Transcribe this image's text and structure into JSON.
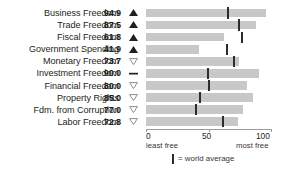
{
  "header": {
    "title": "INDONESIA'S ECONOMIC FREEDOMS"
  },
  "axis": {
    "ticks": [
      "0",
      "50",
      "100"
    ],
    "least_free_label": "least free",
    "most_free_label": "most free",
    "min": 0,
    "max": 100
  },
  "legend": {
    "marker_name": "world-average-marker",
    "text": "= world average"
  },
  "colors": {
    "bar_fill": "#c8c8c8",
    "marker": "#2f2b2c",
    "axis": "#9b9b9b",
    "text": "#231f20"
  },
  "trend_symbols": {
    "up_filled": "up-triangle-filled-icon",
    "down_hollow": "down-triangle-hollow-icon",
    "flat_dash": "flat-dash-icon"
  },
  "chart_data": {
    "type": "bar",
    "title": "INDONESIA'S ECONOMIC FREEDOMS",
    "xlabel": "",
    "ylabel": "",
    "xlim": [
      0,
      100
    ],
    "grid": false,
    "legend_position": "bottom",
    "orientation": "horizontal",
    "categories": [
      "Business Freedom",
      "Trade Freedom",
      "Fiscal Freedom",
      "Government Spending",
      "Monetary Freedom",
      "Investment Freedom",
      "Financial Freedom",
      "Property Rights",
      "Fdm. from Corruption",
      "Labor Freedom"
    ],
    "values": [
      94.9,
      87.5,
      61.8,
      41.9,
      73.7,
      90.0,
      80.0,
      85.0,
      77.0,
      72.8
    ],
    "value_labels": [
      "94.9",
      "87.5",
      "61.8",
      "41.9",
      "73.7",
      "90.0",
      "80.0",
      "85.0",
      "77.0",
      "72.8"
    ],
    "trends": [
      "up",
      "up",
      "up",
      "up",
      "down",
      "flat",
      "down",
      "down",
      "down",
      "down"
    ],
    "world_average": [
      65,
      74,
      76,
      64,
      70,
      49,
      50,
      43,
      40,
      61
    ],
    "series": [
      {
        "name": "Indonesia score",
        "values": [
          94.9,
          87.5,
          61.8,
          41.9,
          73.7,
          90.0,
          80.0,
          85.0,
          77.0,
          72.8
        ]
      },
      {
        "name": "world average",
        "values": [
          65,
          74,
          76,
          64,
          70,
          49,
          50,
          43,
          40,
          61
        ]
      }
    ],
    "rows": [
      {
        "label": "Business Freedom",
        "value": "94.9",
        "score": 94.9,
        "avg": 65,
        "trend": "up"
      },
      {
        "label": "Trade Freedom",
        "value": "87.5",
        "score": 87.5,
        "avg": 74,
        "trend": "up"
      },
      {
        "label": "Fiscal Freedom",
        "value": "61.8",
        "score": 61.8,
        "avg": 76,
        "trend": "up"
      },
      {
        "label": "Government Spending",
        "value": "41.9",
        "score": 41.9,
        "avg": 64,
        "trend": "up"
      },
      {
        "label": "Monetary Freedom",
        "value": "73.7",
        "score": 73.7,
        "avg": 70,
        "trend": "down"
      },
      {
        "label": "Investment Freedom",
        "value": "90.0",
        "score": 90.0,
        "avg": 49,
        "trend": "flat"
      },
      {
        "label": "Financial Freedom",
        "value": "80.0",
        "score": 80.0,
        "avg": 50,
        "trend": "down"
      },
      {
        "label": "Property Rights",
        "value": "85.0",
        "score": 85.0,
        "avg": 43,
        "trend": "down"
      },
      {
        "label": "Fdm. from Corruption",
        "value": "77.0",
        "score": 77.0,
        "avg": 40,
        "trend": "down"
      },
      {
        "label": "Labor Freedom",
        "value": "72.8",
        "score": 72.8,
        "avg": 61,
        "trend": "down"
      }
    ]
  }
}
